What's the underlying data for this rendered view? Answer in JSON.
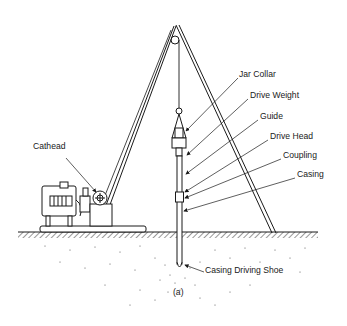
{
  "figure": {
    "caption": "(a)",
    "type": "Cable-tool / driven casing rig schematic",
    "colors": {
      "ink": "#1a1a1a",
      "background": "#ffffff"
    }
  },
  "labels": {
    "jar_collar": "Jar Collar",
    "drive_weight": "Drive Weight",
    "guide": "Guide",
    "drive_head": "Drive Head",
    "coupling": "Coupling",
    "casing": "Casing",
    "cathead": "Cathead",
    "casing_driving_shoe": "Casing Driving Shoe"
  }
}
